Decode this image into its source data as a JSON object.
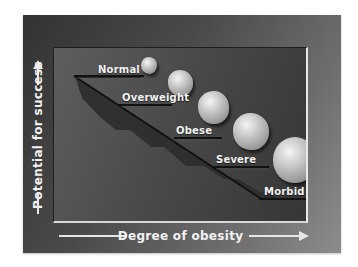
{
  "diagram": {
    "y_axis": {
      "label": "Potential for success",
      "direction": "up"
    },
    "x_axis": {
      "label": "Degree of obesity",
      "direction": "right"
    },
    "steps": [
      {
        "label": "Normal",
        "pebble_size": "smallest"
      },
      {
        "label": "Overweight",
        "pebble_size": "small"
      },
      {
        "label": "Obese",
        "pebble_size": "medium"
      },
      {
        "label": "Severe",
        "pebble_size": "large"
      },
      {
        "label": "Morbid",
        "pebble_size": "largest"
      }
    ],
    "colors": {
      "frame_dark": "#333333",
      "frame_light": "#8c8c8c",
      "panel": "#4a4a4a",
      "text": "#f2f2f2",
      "pebble": "#c8c8c8"
    }
  }
}
